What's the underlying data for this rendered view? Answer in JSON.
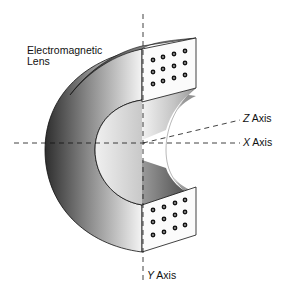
{
  "diagram": {
    "title_label": {
      "line1": "Electromagnetic",
      "line2": "Lens"
    },
    "axes": {
      "x": {
        "letter": "X",
        "word": "Axis"
      },
      "y": {
        "letter": "Y",
        "word": "Axis"
      },
      "z": {
        "letter": "Z",
        "word": "Axis"
      }
    },
    "component": "electromagnetic-lens-c-shape",
    "pole_faces": [
      {
        "name": "top",
        "hole_rows": 3,
        "hole_cols": 4
      },
      {
        "name": "bottom",
        "hole_rows": 3,
        "hole_cols": 4
      }
    ],
    "colors": {
      "line": "#111111",
      "shade_dark": "#3a3a3a",
      "shade_light": "#f2f2f2",
      "background": "#ffffff"
    }
  }
}
